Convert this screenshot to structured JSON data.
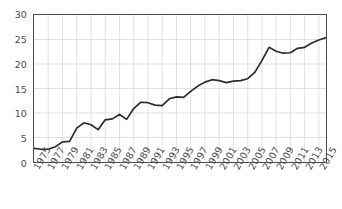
{
  "chart_data": {
    "type": "line",
    "title": "",
    "subtitle": "",
    "xlabel": "",
    "ylabel": "",
    "xlim": [
      1975,
      2016
    ],
    "ylim": [
      0,
      30
    ],
    "yticks": [
      0,
      5,
      10,
      15,
      20,
      25,
      30
    ],
    "ytick_labels": [
      "0",
      "5",
      "10",
      "15",
      "20",
      "25",
      "30"
    ],
    "xticks": [
      1975,
      1977,
      1979,
      1981,
      1983,
      1985,
      1987,
      1989,
      1991,
      1993,
      1995,
      1997,
      1999,
      2001,
      2003,
      2005,
      2007,
      2009,
      2011,
      2013,
      2015
    ],
    "xtick_labels": [
      "1975",
      "1977",
      "1979",
      "1981",
      "1983",
      "1985",
      "1987",
      "1989",
      "1991",
      "1993",
      "1995",
      "1997",
      "1999",
      "2001",
      "2003",
      "2005",
      "2007",
      "2009",
      "2011",
      "2013",
      "2015"
    ],
    "xtick_rotation": -60,
    "grid": true,
    "grid_axis": "both",
    "grid_color": "#d9d9d9",
    "legend": false,
    "legend_position": "none",
    "line_color": "#2b2b2b",
    "line_width": 1.7,
    "markers": false,
    "border_color": "#4d4d4d",
    "background": "#ffffff",
    "x": [
      1975,
      1976,
      1977,
      1978,
      1979,
      1980,
      1981,
      1982,
      1983,
      1984,
      1985,
      1986,
      1987,
      1988,
      1989,
      1990,
      1991,
      1992,
      1993,
      1994,
      1995,
      1996,
      1997,
      1998,
      1999,
      2000,
      2001,
      2002,
      2003,
      2004,
      2005,
      2006,
      2007,
      2008,
      2009,
      2010,
      2011,
      2012,
      2013,
      2014,
      2015,
      2016
    ],
    "series": [
      {
        "name": "",
        "values": [
          2.8,
          2.6,
          2.6,
          3.1,
          4.1,
          4.2,
          6.9,
          8.0,
          7.6,
          6.6,
          8.6,
          8.8,
          9.7,
          8.7,
          10.9,
          12.2,
          12.1,
          11.6,
          11.5,
          12.9,
          13.3,
          13.2,
          14.4,
          15.5,
          16.3,
          16.8,
          16.6,
          16.2,
          16.5,
          16.6,
          17.0,
          18.3,
          20.7,
          23.4,
          22.6,
          22.2,
          22.3,
          23.2,
          23.4,
          24.3,
          24.9,
          25.4
        ]
      }
    ],
    "series_full": {
      "comment_free_values_by_year": [
        {
          "year": 1975,
          "value": 2.8
        },
        {
          "year": 1976,
          "value": 2.6
        },
        {
          "year": 1977,
          "value": 2.6
        },
        {
          "year": 1978,
          "value": 3.1
        },
        {
          "year": 1979,
          "value": 4.1
        },
        {
          "year": 1980,
          "value": 4.2
        },
        {
          "year": 1981,
          "value": 6.9
        },
        {
          "year": 1982,
          "value": 8.0
        },
        {
          "year": 1983,
          "value": 7.6
        },
        {
          "year": 1984,
          "value": 6.6
        },
        {
          "year": 1985,
          "value": 8.6
        },
        {
          "year": 1986,
          "value": 8.8
        },
        {
          "year": 1987,
          "value": 9.7
        },
        {
          "year": 1988,
          "value": 8.7
        },
        {
          "year": 1989,
          "value": 10.9
        },
        {
          "year": 1990,
          "value": 12.2
        },
        {
          "year": 1991,
          "value": 12.1
        },
        {
          "year": 1992,
          "value": 11.6
        },
        {
          "year": 1993,
          "value": 11.5
        },
        {
          "year": 1994,
          "value": 12.9
        },
        {
          "year": 1995,
          "value": 13.3
        },
        {
          "year": 1996,
          "value": 13.2
        },
        {
          "year": 1997,
          "value": 14.4
        },
        {
          "year": 1998,
          "value": 15.5
        },
        {
          "year": 1999,
          "value": 16.3
        },
        {
          "year": 2000,
          "value": 16.8
        },
        {
          "year": 2001,
          "value": 16.6
        },
        {
          "year": 2002,
          "value": 16.2
        },
        {
          "year": 2003,
          "value": 16.5
        },
        {
          "year": 2004,
          "value": 16.6
        },
        {
          "year": 2005,
          "value": 17.0
        },
        {
          "year": 2006,
          "value": 18.3
        },
        {
          "year": 2007,
          "value": 20.7
        },
        {
          "year": 2008,
          "value": 23.4
        },
        {
          "year": 2009,
          "value": 22.6
        },
        {
          "year": 2010,
          "value": 22.2
        },
        {
          "year": 2011,
          "value": 22.3
        },
        {
          "year": 2012,
          "value": 23.2
        },
        {
          "year": 2013,
          "value": 23.4
        },
        {
          "year": 2014,
          "value": 24.3
        },
        {
          "year": 2015,
          "value": 24.9
        },
        {
          "year": 2016,
          "value": 25.4
        }
      ]
    }
  }
}
